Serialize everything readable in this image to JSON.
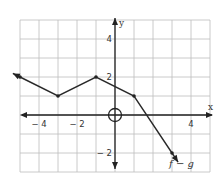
{
  "chart_data": {
    "type": "line",
    "title": "",
    "xlabel": "x",
    "ylabel": "y",
    "xlim": [
      -5,
      5
    ],
    "ylim": [
      -3,
      5
    ],
    "grid": true,
    "x_ticks": [
      {
        "value": -4,
        "label": "− 4"
      },
      {
        "value": -2,
        "label": "− 2"
      },
      {
        "value": 4,
        "label": "4"
      }
    ],
    "y_ticks": [
      {
        "value": 4,
        "label": "4"
      },
      {
        "value": 2,
        "label": "2"
      },
      {
        "value": -2,
        "label": "− 2"
      }
    ],
    "series": [
      {
        "name": "f − g",
        "points": [
          [
            -5,
            2
          ],
          [
            -3,
            1
          ],
          [
            -1,
            2
          ],
          [
            1,
            1
          ],
          [
            3,
            -2
          ]
        ],
        "arrow_left": true,
        "arrow_right": true
      }
    ],
    "annotations": [
      {
        "type": "open-circle",
        "at": [
          0,
          0
        ],
        "note": "circled origin"
      }
    ],
    "series_label": "f − g"
  }
}
